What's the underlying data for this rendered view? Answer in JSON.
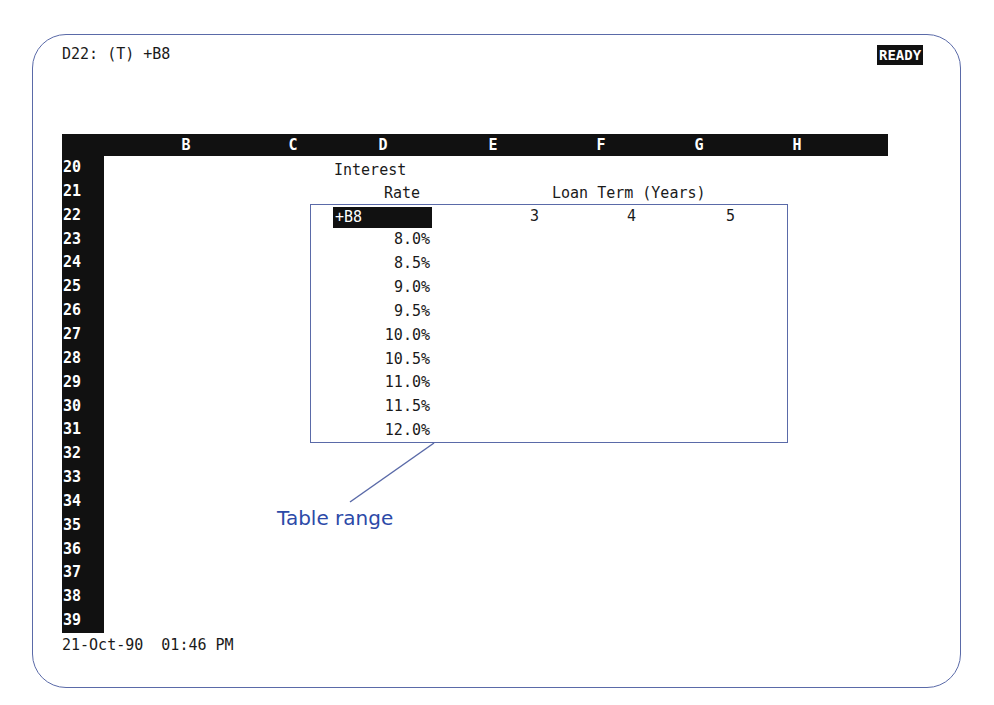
{
  "screen": {
    "cell_indicator": "D22: (T) +B8",
    "mode_indicator": "READY",
    "status_line": "21-Oct-90  01:46 PM"
  },
  "columns": [
    {
      "letter": "B",
      "x": 176
    },
    {
      "letter": "C",
      "x": 283
    },
    {
      "letter": "D",
      "x": 373
    },
    {
      "letter": "E",
      "x": 483
    },
    {
      "letter": "F",
      "x": 591
    },
    {
      "letter": "G",
      "x": 689
    },
    {
      "letter": "H",
      "x": 787
    }
  ],
  "rows": [
    "20",
    "21",
    "22",
    "23",
    "24",
    "25",
    "26",
    "27",
    "28",
    "29",
    "30",
    "31",
    "32",
    "33",
    "34",
    "35",
    "36",
    "37",
    "38",
    "39"
  ],
  "sheet": {
    "d20": "Interest",
    "d21": "Rate",
    "loan_term_header": "Loan Term (Years)",
    "d22_cursor": "+B8",
    "terms": [
      "3",
      "4",
      "5"
    ],
    "rates": [
      "8.0%",
      "8.5%",
      "9.0%",
      "9.5%",
      "10.0%",
      "10.5%",
      "11.0%",
      "11.5%",
      "12.0%"
    ]
  },
  "annotation": {
    "label": "Table range",
    "color": "#2c4aa8"
  },
  "colors": {
    "frame": "#5a6aa8",
    "header_bg": "#111111",
    "header_fg": "#ffffff"
  }
}
